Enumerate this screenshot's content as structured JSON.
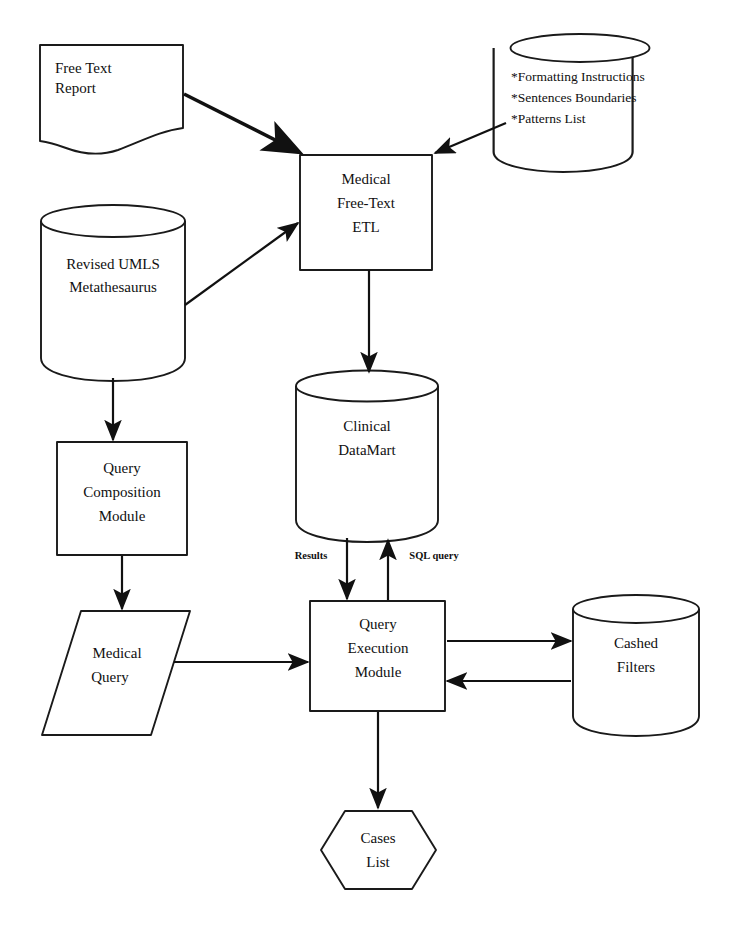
{
  "figure": {
    "caption": "",
    "background_color": "#ffffff",
    "line_color": "#111111"
  },
  "nodes": {
    "free_text_report": {
      "shape": "document",
      "lines": [
        "Free Text",
        "Report"
      ]
    },
    "rules_store": {
      "shape": "cylinder",
      "lines": [
        "*Formatting Instructions",
        "*Sentences Boundaries",
        "*Patterns List"
      ]
    },
    "medical_etl": {
      "shape": "process",
      "lines": [
        "Medical",
        "Free-Text",
        "ETL"
      ]
    },
    "umls": {
      "shape": "cylinder",
      "lines": [
        "Revised UMLS",
        "Metathesaurus"
      ]
    },
    "clinical_datamart": {
      "shape": "cylinder",
      "lines": [
        "Clinical",
        "DataMart"
      ]
    },
    "query_composition": {
      "shape": "process",
      "lines": [
        "Query",
        "Composition",
        "Module"
      ]
    },
    "medical_query": {
      "shape": "parallelogram",
      "lines": [
        "Medical",
        "Query"
      ]
    },
    "query_execution": {
      "shape": "process",
      "lines": [
        "Query",
        "Execution",
        "Module"
      ]
    },
    "cashed_filters": {
      "shape": "cylinder",
      "lines": [
        "Cashed",
        "Filters"
      ]
    },
    "cases_list": {
      "shape": "hexagon",
      "lines": [
        "Cases",
        "List"
      ]
    }
  },
  "edges": [
    {
      "id": "report-to-etl",
      "from": "free_text_report",
      "to": "medical_etl",
      "label": "",
      "style": "thick"
    },
    {
      "id": "rules-to-etl",
      "from": "rules_store",
      "to": "medical_etl",
      "label": "",
      "style": "thin"
    },
    {
      "id": "umls-to-etl",
      "from": "umls",
      "to": "medical_etl",
      "label": "",
      "style": "thin"
    },
    {
      "id": "etl-to-datamart",
      "from": "medical_etl",
      "to": "clinical_datamart",
      "label": "",
      "style": "thin"
    },
    {
      "id": "umls-to-composition",
      "from": "umls",
      "to": "query_composition",
      "label": "",
      "style": "thin"
    },
    {
      "id": "composition-to-query",
      "from": "query_composition",
      "to": "medical_query",
      "label": "",
      "style": "thin"
    },
    {
      "id": "query-to-execution",
      "from": "medical_query",
      "to": "query_execution",
      "label": "",
      "style": "thin"
    },
    {
      "id": "datamart-to-execution",
      "from": "clinical_datamart",
      "to": "query_execution",
      "label": "Results",
      "style": "thin"
    },
    {
      "id": "execution-to-datamart",
      "from": "query_execution",
      "to": "clinical_datamart",
      "label": "SQL query",
      "style": "thin"
    },
    {
      "id": "execution-to-filters",
      "from": "query_execution",
      "to": "cashed_filters",
      "label": "",
      "style": "thin"
    },
    {
      "id": "filters-to-execution",
      "from": "cashed_filters",
      "to": "query_execution",
      "label": "",
      "style": "thin"
    },
    {
      "id": "execution-to-cases",
      "from": "query_execution",
      "to": "cases_list",
      "label": "",
      "style": "thin"
    }
  ],
  "edge_labels": {
    "results": "Results",
    "sql_query": "SQL query"
  }
}
